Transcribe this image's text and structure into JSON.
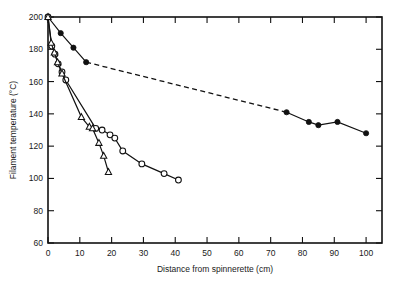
{
  "chart_data": {
    "type": "line",
    "title": "",
    "xlabel": "Distance from spinnerette (cm)",
    "ylabel": "Filament temperature (°C)",
    "xlim": [
      0,
      105
    ],
    "ylim": [
      60,
      200
    ],
    "xticks": [
      0,
      10,
      20,
      30,
      40,
      50,
      60,
      70,
      80,
      90,
      100
    ],
    "xticklabels": [
      "0",
      "10",
      "20",
      "30",
      "40",
      "50",
      "60",
      "70",
      "80",
      "90",
      "100"
    ],
    "yticks": [
      60,
      80,
      100,
      120,
      140,
      160,
      180,
      200
    ],
    "yticklabels": [
      "60",
      "80",
      "100",
      "120",
      "140",
      "160",
      "180",
      "200"
    ],
    "grid": false,
    "legend": "none",
    "series": [
      {
        "name": "filled-circle-series",
        "marker": "filled-circle",
        "linestyle": "solid-with-dashed-gap",
        "x": [
          0,
          4,
          8,
          12,
          75,
          82,
          85,
          91,
          100
        ],
        "y": [
          200,
          190,
          181,
          172,
          141,
          135,
          133,
          135,
          128
        ],
        "dashed_segment_between_index": [
          3,
          4
        ]
      },
      {
        "name": "open-circle-series",
        "marker": "open-circle",
        "linestyle": "solid",
        "x": [
          0,
          1.2,
          2.2,
          3.2,
          4.4,
          5.6,
          15,
          17,
          19.5,
          21,
          23.5,
          29.5,
          36.5,
          41
        ],
        "y": [
          200,
          182,
          177,
          171,
          166,
          161,
          131,
          130,
          127,
          125,
          117,
          109,
          103,
          99
        ],
        "note": "second open-circle point cluster near origin descends steeply"
      },
      {
        "name": "open-triangle-series",
        "marker": "open-triangle",
        "linestyle": "solid",
        "x": [
          0,
          1.0,
          2.0,
          3.0,
          4.4,
          10.5,
          13,
          14,
          16,
          17.5,
          19
        ],
        "y": [
          200,
          184,
          178,
          172,
          165,
          138,
          132,
          131,
          122,
          114,
          104
        ]
      }
    ]
  },
  "axes": {
    "y_axis_title": "Filament temperature (°C)",
    "x_axis_title": "Distance from spinnerette (cm)"
  }
}
